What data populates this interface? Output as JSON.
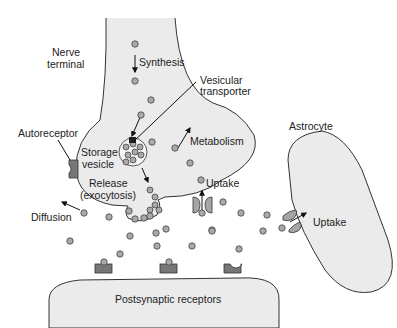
{
  "diagram": {
    "type": "synapse schematic",
    "labels": {
      "nerve_terminal_1": "Nerve",
      "nerve_terminal_2": "terminal",
      "synthesis": "Synthesis",
      "vesicular_transporter_1": "Vesicular",
      "vesicular_transporter_2": "transporter",
      "autoreceptor": "Autoreceptor",
      "storage_vesicle_1": "Storage",
      "storage_vesicle_2": "vesicle",
      "metabolism": "Metabolism",
      "release_1": "Release",
      "release_2": "(exocytosis)",
      "uptake_terminal": "Uptake",
      "diffusion": "Diffusion",
      "astrocyte": "Astrocyte",
      "uptake_astrocyte": "Uptake",
      "postsynaptic": "Postsynaptic receptors"
    },
    "colors": {
      "cell_fill": "#ebebeb",
      "neurotransmitter": "#a9a9a9",
      "receptor": "#777777",
      "outline": "#333333"
    }
  }
}
